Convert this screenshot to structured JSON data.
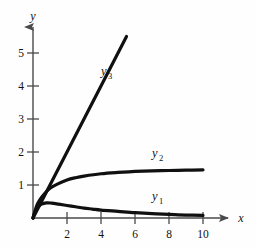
{
  "chart_data": {
    "type": "line",
    "title": "",
    "subtitle": "",
    "xlabel": "x",
    "ylabel": "y",
    "xlim": [
      0,
      11.6
    ],
    "ylim": [
      0,
      5.9
    ],
    "grid": false,
    "legend_position": "inline-curve-labels",
    "xticks": [
      2,
      4,
      6,
      8,
      10
    ],
    "yticks": [
      1,
      2,
      3,
      4,
      5
    ],
    "xtick_labels": [
      "2",
      "4",
      "6",
      "8",
      "10"
    ],
    "ytick_labels": [
      "1",
      "2",
      "3",
      "4",
      "5"
    ],
    "axis_style": "arrow-terminated",
    "curve_color": "#101010",
    "axis_color": "#4a4a4a",
    "background_color": "#fefefe",
    "series": [
      {
        "name": "y_1",
        "label": "y",
        "label_subscript": "1",
        "description": "rises to a small maximum near x = 0.8 then decays slowly toward zero",
        "x": [
          0,
          0.15,
          0.3,
          0.5,
          0.8,
          1.1,
          1.5,
          2,
          2.5,
          3,
          3.5,
          4,
          5,
          6,
          7,
          8,
          9,
          10
        ],
        "values": [
          0,
          0.22,
          0.33,
          0.42,
          0.46,
          0.45,
          0.42,
          0.38,
          0.34,
          0.3,
          0.27,
          0.24,
          0.2,
          0.16,
          0.13,
          0.11,
          0.09,
          0.08
        ],
        "label_x": 7.0,
        "label_y": 0.55
      },
      {
        "name": "y_2",
        "label": "y",
        "label_subscript": "2",
        "description": "rises steeply from origin and levels off at an asymptote of about 1.45",
        "x": [
          0,
          0.2,
          0.4,
          0.7,
          1,
          1.4,
          2,
          2.5,
          3,
          4,
          5,
          6,
          7,
          8,
          9,
          10
        ],
        "values": [
          0,
          0.35,
          0.55,
          0.75,
          0.9,
          1.02,
          1.15,
          1.22,
          1.27,
          1.34,
          1.38,
          1.41,
          1.43,
          1.44,
          1.45,
          1.46
        ],
        "label_x": 7.0,
        "label_y": 1.85,
        "asymptote": 1.45
      },
      {
        "name": "y_3",
        "label": "y",
        "label_subscript": "3",
        "description": "straight line through the origin with slope about 1",
        "x": [
          0,
          5.5
        ],
        "values": [
          0,
          5.5
        ],
        "label_x": 4.0,
        "label_y": 4.35,
        "slope": 1.0
      }
    ]
  }
}
